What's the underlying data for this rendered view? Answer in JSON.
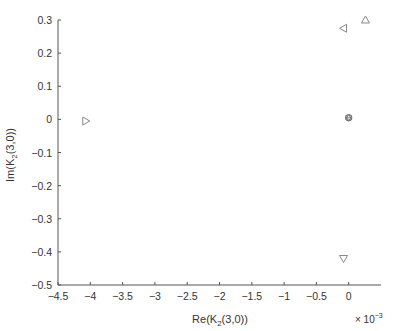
{
  "chart_data": {
    "type": "scatter",
    "title": "",
    "xlabel": "Re(K2(3,0))",
    "ylabel": "Im(K2(3,0))",
    "x_multiplier": "× 10^-3",
    "xlim": [
      -4.5,
      0.5
    ],
    "ylim": [
      -0.5,
      0.3
    ],
    "x_ticks": [
      "-4.5",
      "-4",
      "-3.5",
      "-3",
      "-2.5",
      "-2",
      "-1.5",
      "-1",
      "-0.5",
      "0"
    ],
    "y_ticks": [
      "0.3",
      "0.2",
      "0.1",
      "0",
      "-0.1",
      "-0.2",
      "-0.3",
      "-0.4",
      "-0.5"
    ],
    "grid": false,
    "legend": null,
    "series": [
      {
        "name": "triangle-right",
        "marker": "triangle-right",
        "x": [
          -4.07
        ],
        "y": [
          -0.005
        ]
      },
      {
        "name": "triangle-left",
        "marker": "triangle-left",
        "x": [
          -0.08
        ],
        "y": [
          0.275
        ]
      },
      {
        "name": "triangle-up",
        "marker": "triangle-up",
        "x": [
          0.26
        ],
        "y": [
          0.3
        ]
      },
      {
        "name": "triangle-down",
        "marker": "triangle-down",
        "x": [
          -0.08
        ],
        "y": [
          -0.42
        ]
      },
      {
        "name": "cluster-at-origin",
        "marker": "hexagram",
        "x": [
          0.0
        ],
        "y": [
          0.005
        ]
      }
    ]
  },
  "labels": {
    "xlabel_main": "Re(K",
    "xlabel_sub": "2",
    "xlabel_tail": "(3,0))",
    "ylabel_main": "Im(K",
    "ylabel_sub": "2",
    "ylabel_tail": "(3,0))",
    "mult_base": "× 10",
    "mult_exp": "−3"
  },
  "tick_labels": {
    "x": [
      "−4.5",
      "−4",
      "−3.5",
      "−3",
      "−2.5",
      "−2",
      "−1.5",
      "−1",
      "−0.5",
      "0"
    ],
    "y": [
      "0.3",
      "0.2",
      "0.1",
      "0",
      "−0.1",
      "−0.2",
      "−0.3",
      "−0.4",
      "−0.5"
    ]
  }
}
